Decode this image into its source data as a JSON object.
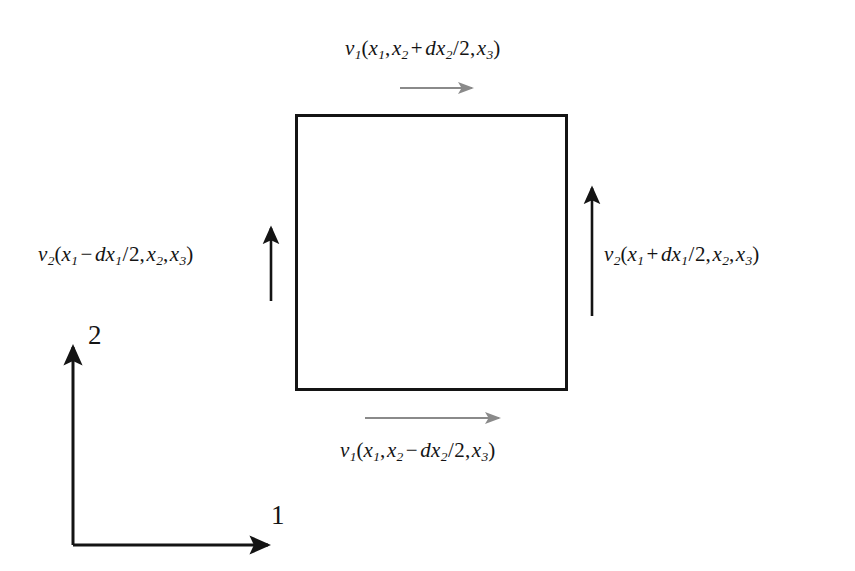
{
  "figure": {
    "background_color": "#ffffff",
    "stroke_color": "#141414",
    "gray_arrow_color": "#8a8a8a"
  },
  "labels": {
    "top_flux": {
      "name": "v1-top-flux-label",
      "text": "v1(x1,x2 + dx2/2,x3)",
      "function": "v",
      "function_sub": "1",
      "arg1": "x",
      "arg1_sub": "1",
      "arg2": "x",
      "arg2_sub": "2",
      "operator": "+",
      "delta": "dx",
      "delta_sub": "2",
      "divisor": "2",
      "arg3": "x",
      "arg3_sub": "3"
    },
    "bottom_flux": {
      "name": "v1-bottom-flux-label",
      "text": "v1(x1,x2 - dx2/2,x3)",
      "function": "v",
      "function_sub": "1",
      "arg1": "x",
      "arg1_sub": "1",
      "arg2": "x",
      "arg2_sub": "2",
      "operator": "−",
      "delta": "dx",
      "delta_sub": "2",
      "divisor": "2",
      "arg3": "x",
      "arg3_sub": "3"
    },
    "left_flux": {
      "name": "v2-left-flux-label",
      "text": "v2(x1 - dx1/2,x2,x3)",
      "function": "v",
      "function_sub": "2",
      "arg1": "x",
      "arg1_sub": "1",
      "operator": "−",
      "delta": "dx",
      "delta_sub": "1",
      "divisor": "2",
      "arg2": "x",
      "arg2_sub": "2",
      "arg3": "x",
      "arg3_sub": "3"
    },
    "right_flux": {
      "name": "v2-right-flux-label",
      "text": "v2(x1 + dx1/2,x2,x3)",
      "function": "v",
      "function_sub": "2",
      "arg1": "x",
      "arg1_sub": "1",
      "operator": "+",
      "delta": "dx",
      "delta_sub": "1",
      "divisor": "2",
      "arg2": "x",
      "arg2_sub": "2",
      "arg3": "x",
      "arg3_sub": "3"
    }
  },
  "axes": {
    "horizontal_label": "1",
    "vertical_label": "2",
    "origin_x": 73,
    "origin_y": 545,
    "horizontal_tip_x": 272,
    "vertical_tip_y": 343
  },
  "control_volume": {
    "name": "control-volume-square",
    "left": 296,
    "top": 115,
    "right": 567,
    "bottom": 390
  },
  "arrows": {
    "top_gray": {
      "x1": 400,
      "x2": 474,
      "y": 88,
      "direction": "right",
      "color": "#8a8a8a"
    },
    "bottom_gray": {
      "x1": 365,
      "x2": 501,
      "y": 418,
      "direction": "right",
      "color": "#8a8a8a"
    },
    "left_black": {
      "x": 271,
      "y1": 301,
      "y2": 224,
      "direction": "up",
      "color": "#141414"
    },
    "right_black": {
      "x": 592,
      "y1": 316,
      "y2": 184,
      "direction": "up",
      "color": "#141414"
    }
  }
}
